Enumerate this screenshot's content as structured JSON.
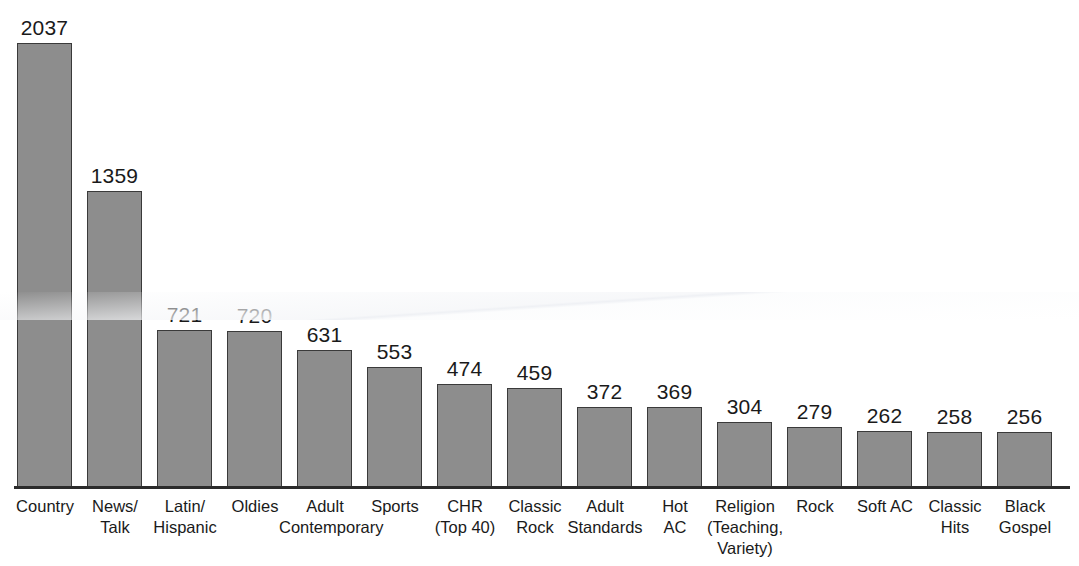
{
  "chart_data": {
    "type": "bar",
    "title": "",
    "subtitle": "",
    "xlabel": "",
    "ylabel": "",
    "ylim": [
      0,
      2037
    ],
    "grid": false,
    "legend_position": "none",
    "orientation": "vertical",
    "bar_color": "#8d8d8d",
    "bar_border_color": "#3a3a3a",
    "axis_color": "#2b2b2b",
    "background_color": "#ffffff",
    "text_color": "#1a1a1a",
    "categories": [
      "Country",
      "News/ Talk",
      "Latin/ Hispanic",
      "Oldies",
      "Adult Contemporary",
      "Sports",
      "CHR (Top 40)",
      "Classic Rock",
      "Adult Standards",
      "Hot AC",
      "Religion (Teaching, Variety)",
      "Rock",
      "Soft AC",
      "Classic Hits",
      "Black Gospel"
    ],
    "category_lines": [
      [
        "Country"
      ],
      [
        "News/",
        "Talk"
      ],
      [
        "Latin/",
        "Hispanic"
      ],
      [
        "Oldies"
      ],
      [
        "Adult",
        "Contemporary"
      ],
      [
        "Sports"
      ],
      [
        "CHR",
        "(Top 40)"
      ],
      [
        "Classic",
        "Rock"
      ],
      [
        "Adult",
        "Standards"
      ],
      [
        "Hot",
        "AC"
      ],
      [
        "Religion",
        "(Teaching,",
        "Variety)"
      ],
      [
        "Rock"
      ],
      [
        "Soft AC"
      ],
      [
        "Classic",
        "Hits"
      ],
      [
        "Black",
        "Gospel"
      ]
    ],
    "values": [
      2037,
      1359,
      721,
      720,
      631,
      553,
      474,
      459,
      372,
      369,
      304,
      279,
      262,
      258,
      256
    ],
    "value_labels": [
      "2037",
      "1359",
      "721",
      "720",
      "631",
      "553",
      "474",
      "459",
      "372",
      "369",
      "304",
      "279",
      "262",
      "258",
      "256"
    ]
  }
}
